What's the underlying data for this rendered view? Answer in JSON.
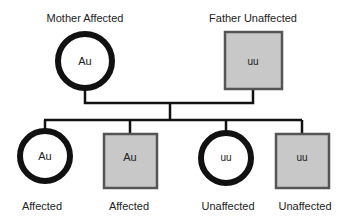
{
  "parents": {
    "mother": {
      "label": "Mother Affected",
      "genotype": "Au",
      "sex": "female",
      "affected": true
    },
    "father": {
      "label": "Father Unaffected",
      "genotype": "uu",
      "sex": "male",
      "affected": false
    }
  },
  "children": [
    {
      "label": "Affected",
      "genotype": "Au",
      "sex": "female"
    },
    {
      "label": "Affected",
      "genotype": "Au",
      "sex": "male"
    },
    {
      "label": "Unaffected",
      "genotype": "uu",
      "sex": "female"
    },
    {
      "label": "Unaffected",
      "genotype": "uu",
      "sex": "male"
    }
  ],
  "colors": {
    "line": "#111111",
    "male_fill": "#c8c8c8",
    "male_border": "#555555"
  }
}
